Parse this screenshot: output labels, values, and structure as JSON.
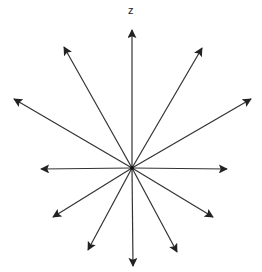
{
  "diagram": {
    "title": "",
    "center": [
      132,
      168
    ],
    "stroke_color": "#333333",
    "background": "#ffffff",
    "axis_label": "z",
    "axis_label_pos": [
      128,
      4
    ],
    "arrows": [
      {
        "name": "arrow-up-z",
        "tip": [
          132,
          30
        ]
      },
      {
        "name": "arrow-upper-left-1",
        "tip": [
          64,
          47
        ]
      },
      {
        "name": "arrow-upper-left-2",
        "tip": [
          14,
          99
        ]
      },
      {
        "name": "arrow-left",
        "tip": [
          41,
          169
        ]
      },
      {
        "name": "arrow-lower-left-1",
        "tip": [
          53,
          217
        ]
      },
      {
        "name": "arrow-lower-left-2",
        "tip": [
          88,
          250
        ]
      },
      {
        "name": "arrow-down",
        "tip": [
          133,
          266
        ]
      },
      {
        "name": "arrow-lower-right-2",
        "tip": [
          177,
          252
        ]
      },
      {
        "name": "arrow-lower-right-1",
        "tip": [
          213,
          217
        ]
      },
      {
        "name": "arrow-right",
        "tip": [
          227,
          169
        ]
      },
      {
        "name": "arrow-upper-right-2",
        "tip": [
          251,
          99
        ]
      },
      {
        "name": "arrow-upper-right-1",
        "tip": [
          202,
          48
        ]
      }
    ]
  }
}
